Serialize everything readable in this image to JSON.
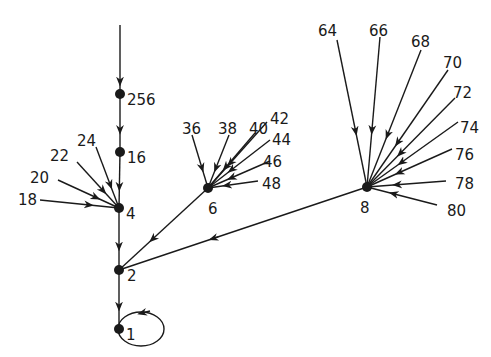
{
  "diagram": {
    "type": "directed-graph",
    "colors": {
      "ink": "#1a1a1a",
      "background": "#ffffff"
    },
    "nodes": [
      {
        "id": "256",
        "label": "256",
        "x": 120,
        "y": 94,
        "lx": 127,
        "ly": 100,
        "dot": true
      },
      {
        "id": "16",
        "label": "16",
        "x": 120,
        "y": 152,
        "lx": 127,
        "ly": 158,
        "dot": true
      },
      {
        "id": "4",
        "label": "4",
        "x": 119,
        "y": 208,
        "lx": 126,
        "ly": 214,
        "dot": true
      },
      {
        "id": "2",
        "label": "2",
        "x": 119,
        "y": 270,
        "lx": 127,
        "ly": 276,
        "dot": true
      },
      {
        "id": "1",
        "label": "1",
        "x": 119,
        "y": 329,
        "lx": 126,
        "ly": 335,
        "dot": true
      },
      {
        "id": "6",
        "label": "6",
        "x": 208,
        "y": 188,
        "lx": 208,
        "ly": 209,
        "dot": true
      },
      {
        "id": "8",
        "label": "8",
        "x": 367,
        "y": 187,
        "lx": 360,
        "ly": 208,
        "dot": true
      },
      {
        "id": "18",
        "label": "18",
        "x": 40,
        "y": 200,
        "lx": 18,
        "ly": 200,
        "dot": false
      },
      {
        "id": "20",
        "label": "20",
        "x": 58,
        "y": 180,
        "lx": 30,
        "ly": 178,
        "dot": false
      },
      {
        "id": "22",
        "label": "22",
        "x": 77,
        "y": 162,
        "lx": 50,
        "ly": 156,
        "dot": false
      },
      {
        "id": "24",
        "label": "24",
        "x": 96,
        "y": 147,
        "lx": 77,
        "ly": 141,
        "dot": false
      },
      {
        "id": "36",
        "label": "36",
        "x": 192,
        "y": 135,
        "lx": 182,
        "ly": 129,
        "dot": false
      },
      {
        "id": "38",
        "label": "38",
        "x": 229,
        "y": 135,
        "lx": 218,
        "ly": 129,
        "dot": false
      },
      {
        "id": "40",
        "label": "40",
        "x": 255,
        "y": 133,
        "lx": 249,
        "ly": 129,
        "dot": false
      },
      {
        "id": "42",
        "label": "42",
        "x": 267,
        "y": 122,
        "lx": 270,
        "ly": 119,
        "dot": false
      },
      {
        "id": "44",
        "label": "44",
        "x": 270,
        "y": 140,
        "lx": 272,
        "ly": 140,
        "dot": false
      },
      {
        "id": "46",
        "label": "46",
        "x": 270,
        "y": 161,
        "lx": 263,
        "ly": 162,
        "dot": false
      },
      {
        "id": "48",
        "label": "48",
        "x": 258,
        "y": 181,
        "lx": 262,
        "ly": 184,
        "dot": false
      },
      {
        "id": "64",
        "label": "64",
        "x": 337,
        "y": 40,
        "lx": 318,
        "ly": 31,
        "dot": false
      },
      {
        "id": "66",
        "label": "66",
        "x": 380,
        "y": 37,
        "lx": 369,
        "ly": 31,
        "dot": false
      },
      {
        "id": "68",
        "label": "68",
        "x": 421,
        "y": 50,
        "lx": 411,
        "ly": 42,
        "dot": false
      },
      {
        "id": "70",
        "label": "70",
        "x": 448,
        "y": 70,
        "lx": 443,
        "ly": 63,
        "dot": false
      },
      {
        "id": "72",
        "label": "72",
        "x": 455,
        "y": 98,
        "lx": 453,
        "ly": 93,
        "dot": false
      },
      {
        "id": "74",
        "label": "74",
        "x": 458,
        "y": 122,
        "lx": 460,
        "ly": 128,
        "dot": false
      },
      {
        "id": "76",
        "label": "76",
        "x": 452,
        "y": 149,
        "lx": 455,
        "ly": 155,
        "dot": false
      },
      {
        "id": "78",
        "label": "78",
        "x": 446,
        "y": 181,
        "lx": 455,
        "ly": 184,
        "dot": false
      },
      {
        "id": "80",
        "label": "80",
        "x": 437,
        "y": 205,
        "lx": 447,
        "ly": 211,
        "dot": false
      }
    ],
    "edges": [
      {
        "from": "top",
        "to": "256",
        "x1": 120,
        "y1": 25,
        "x2": 120,
        "y2": 94
      },
      {
        "from": "256",
        "to": "16"
      },
      {
        "from": "16",
        "to": "4"
      },
      {
        "from": "4",
        "to": "2"
      },
      {
        "from": "2",
        "to": "1"
      },
      {
        "from": "6",
        "to": "2"
      },
      {
        "from": "8",
        "to": "2"
      },
      {
        "from": "18",
        "to": "4"
      },
      {
        "from": "20",
        "to": "4"
      },
      {
        "from": "22",
        "to": "4"
      },
      {
        "from": "24",
        "to": "4"
      },
      {
        "from": "36",
        "to": "6"
      },
      {
        "from": "38",
        "to": "6"
      },
      {
        "from": "40",
        "to": "6"
      },
      {
        "from": "42",
        "to": "6"
      },
      {
        "from": "44",
        "to": "6"
      },
      {
        "from": "46",
        "to": "6"
      },
      {
        "from": "48",
        "to": "6"
      },
      {
        "from": "64",
        "to": "8"
      },
      {
        "from": "66",
        "to": "8"
      },
      {
        "from": "68",
        "to": "8"
      },
      {
        "from": "70",
        "to": "8"
      },
      {
        "from": "72",
        "to": "8"
      },
      {
        "from": "74",
        "to": "8"
      },
      {
        "from": "76",
        "to": "8"
      },
      {
        "from": "78",
        "to": "8"
      },
      {
        "from": "80",
        "to": "8"
      }
    ],
    "self_loop": {
      "node": "1",
      "cx": 141,
      "cy": 329,
      "rx": 23,
      "ry": 17
    }
  }
}
